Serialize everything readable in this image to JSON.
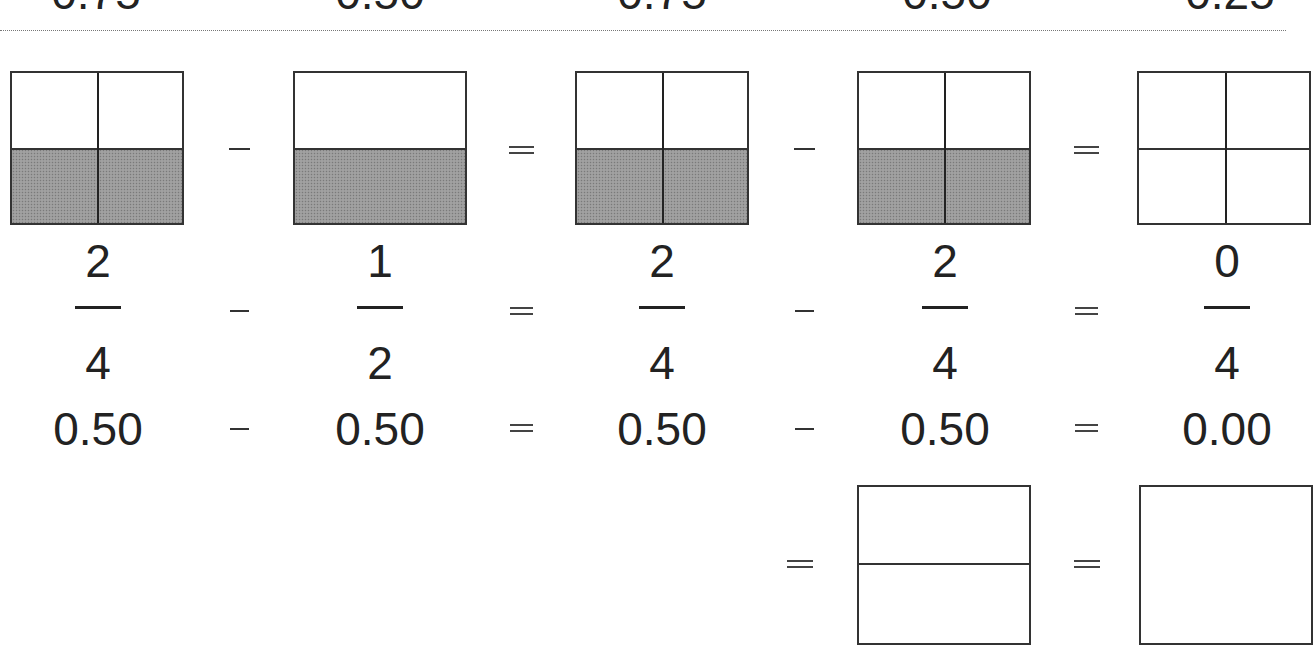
{
  "diagram": {
    "title_hidden": "",
    "top_row_cut": {
      "values": [
        "0.75",
        "0.50",
        "0.75",
        "0.50",
        "0.25"
      ]
    },
    "colors": {
      "ink": "#222222",
      "shade": "#9a9a9a",
      "background": "#ffffff"
    },
    "main_row": {
      "operators": [
        "−",
        "=",
        "−",
        "="
      ],
      "boxes": [
        {
          "id": "box-1",
          "cols": 2,
          "rows": 2,
          "shaded_rows": 1,
          "label": "2/4"
        },
        {
          "id": "box-2",
          "cols": 1,
          "rows": 2,
          "shaded_rows": 1,
          "label": "1/2"
        },
        {
          "id": "box-3",
          "cols": 2,
          "rows": 2,
          "shaded_rows": 1,
          "label": "2/4"
        },
        {
          "id": "box-4",
          "cols": 2,
          "rows": 2,
          "shaded_rows": 1,
          "label": "2/4"
        },
        {
          "id": "box-5",
          "cols": 2,
          "rows": 2,
          "shaded_rows": 0,
          "label": "0/4"
        }
      ],
      "fractions": [
        {
          "numerator": "2",
          "denominator": "4"
        },
        {
          "numerator": "1",
          "denominator": "2"
        },
        {
          "numerator": "2",
          "denominator": "4"
        },
        {
          "numerator": "2",
          "denominator": "4"
        },
        {
          "numerator": "0",
          "denominator": "4"
        }
      ],
      "decimals": [
        "0.50",
        "0.50",
        "0.50",
        "0.50",
        "0.00"
      ]
    },
    "bottom_row": {
      "operators": [
        "=",
        "="
      ],
      "boxes": [
        {
          "id": "box-6",
          "cols": 1,
          "rows": 2,
          "shaded_rows": 0
        },
        {
          "id": "box-7",
          "cols": 1,
          "rows": 1,
          "shaded_rows": 0
        }
      ]
    }
  }
}
